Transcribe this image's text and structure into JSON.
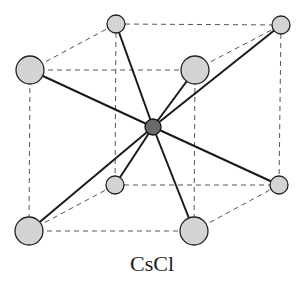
{
  "diagram": {
    "title": "CsCl",
    "type": "crystal-unit-cell",
    "colors": {
      "corner_atom": "#d4d4d4",
      "center_atom": "#6a6a6a",
      "bond": "#1a1a1a",
      "edge": "#555555"
    },
    "corner_atoms": [
      {
        "id": "back-top-left",
        "x": 116,
        "y": 24,
        "r": 9
      },
      {
        "id": "back-top-right",
        "x": 281,
        "y": 25,
        "r": 9
      },
      {
        "id": "front-top-left",
        "x": 30,
        "y": 70,
        "r": 14
      },
      {
        "id": "front-top-right",
        "x": 195,
        "y": 70,
        "r": 14
      },
      {
        "id": "back-bottom-left",
        "x": 115,
        "y": 185,
        "r": 9
      },
      {
        "id": "back-bottom-right",
        "x": 279,
        "y": 185,
        "r": 9
      },
      {
        "id": "front-bottom-left",
        "x": 29,
        "y": 231,
        "r": 14
      },
      {
        "id": "front-bottom-right",
        "x": 194,
        "y": 231,
        "r": 14
      }
    ],
    "center_atom": {
      "id": "center",
      "x": 153,
      "y": 127,
      "r": 8
    },
    "bonds": 8
  }
}
